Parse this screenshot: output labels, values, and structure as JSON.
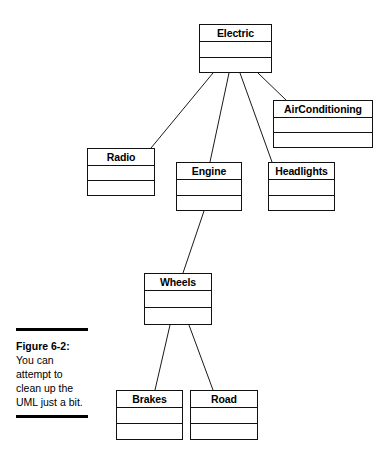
{
  "figure": {
    "label": "Figure 6-2:",
    "body": "You can attempt to clean up the UML just a bit."
  },
  "diagram": {
    "type": "uml-class-diagram",
    "classes": [
      {
        "id": "electric",
        "name": "Electric",
        "x": 199,
        "y": 24,
        "w": 73,
        "h": 49
      },
      {
        "id": "airconditioning",
        "name": "AirConditioning",
        "x": 273,
        "y": 100,
        "w": 100,
        "h": 48
      },
      {
        "id": "radio",
        "name": "Radio",
        "x": 87,
        "y": 148,
        "w": 68,
        "h": 48
      },
      {
        "id": "engine",
        "name": "Engine",
        "x": 176,
        "y": 162,
        "w": 66,
        "h": 49
      },
      {
        "id": "headlights",
        "name": "Headlights",
        "x": 268,
        "y": 162,
        "w": 67,
        "h": 49
      },
      {
        "id": "wheels",
        "name": "Wheels",
        "x": 144,
        "y": 273,
        "w": 68,
        "h": 52
      },
      {
        "id": "brakes",
        "name": "Brakes",
        "x": 116,
        "y": 390,
        "w": 67,
        "h": 50
      },
      {
        "id": "road",
        "name": "Road",
        "x": 190,
        "y": 390,
        "w": 68,
        "h": 50
      }
    ],
    "associations": [
      {
        "from": "electric",
        "to": "radio",
        "x1": 213,
        "y1": 73,
        "x2": 151,
        "y2": 148
      },
      {
        "from": "electric",
        "to": "engine",
        "x1": 229,
        "y1": 73,
        "x2": 210,
        "y2": 162
      },
      {
        "from": "electric",
        "to": "headlights",
        "x1": 240,
        "y1": 73,
        "x2": 272,
        "y2": 162
      },
      {
        "from": "electric",
        "to": "airconditioning",
        "x1": 258,
        "y1": 73,
        "x2": 286,
        "y2": 100
      },
      {
        "from": "engine",
        "to": "wheels",
        "x1": 204,
        "y1": 211,
        "x2": 183,
        "y2": 273
      },
      {
        "from": "wheels",
        "to": "brakes",
        "x1": 170,
        "y1": 325,
        "x2": 155,
        "y2": 390
      },
      {
        "from": "wheels",
        "to": "road",
        "x1": 189,
        "y1": 325,
        "x2": 213,
        "y2": 390
      }
    ]
  }
}
